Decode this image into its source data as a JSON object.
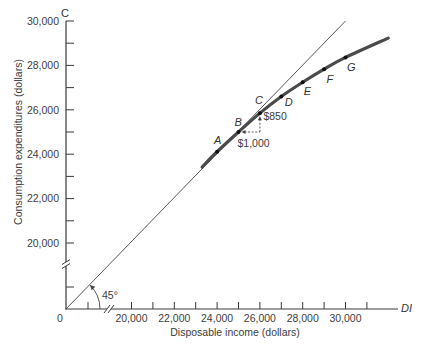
{
  "chart_data": {
    "type": "line",
    "title": "",
    "xlabel": "Disposable income (dollars)",
    "ylabel": "Consumption expenditures (dollars)",
    "x_axis_symbol": "DI",
    "y_axis_symbol": "C",
    "origin_label": "0",
    "xlim": [
      20000,
      31000
    ],
    "ylim": [
      20000,
      30000
    ],
    "axis_breaks": {
      "x": true,
      "y": true
    },
    "grid": false,
    "legend": null,
    "x_axis": {
      "ticks": [
        20000,
        21000,
        22000,
        23000,
        24000,
        25000,
        26000,
        27000,
        28000,
        29000,
        30000,
        31000
      ],
      "tick_labels": [
        {
          "value": 20000,
          "label": "20,000"
        },
        {
          "value": 22000,
          "label": "22,000"
        },
        {
          "value": 24000,
          "label": "24,000"
        },
        {
          "value": 26000,
          "label": "26,000"
        },
        {
          "value": 28000,
          "label": "28,000"
        },
        {
          "value": 30000,
          "label": "30,000"
        }
      ]
    },
    "y_axis": {
      "ticks": [
        20000,
        21000,
        22000,
        23000,
        24000,
        25000,
        26000,
        27000,
        28000,
        29000,
        30000
      ],
      "tick_labels": [
        {
          "value": 20000,
          "label": "20,000"
        },
        {
          "value": 22000,
          "label": "22,000"
        },
        {
          "value": 24000,
          "label": "24,000"
        },
        {
          "value": 26000,
          "label": "26,000"
        },
        {
          "value": 28000,
          "label": "28,000"
        },
        {
          "value": 30000,
          "label": "30,000"
        }
      ]
    },
    "series": [
      {
        "name": "Consumption function",
        "type": "curve",
        "color": "#4a4a4a",
        "points": [
          {
            "label": "A",
            "x": 24000,
            "y": 24110
          },
          {
            "label": "B",
            "x": 25000,
            "y": 25000
          },
          {
            "label": "C",
            "x": 26000,
            "y": 25850
          },
          {
            "label": "D",
            "x": 27000,
            "y": 26600
          },
          {
            "label": "E",
            "x": 28000,
            "y": 27240
          },
          {
            "label": "F",
            "x": 29000,
            "y": 27830
          },
          {
            "label": "G",
            "x": 30000,
            "y": 28360
          }
        ],
        "extent": {
          "start": [
            23300,
            23420
          ],
          "end": [
            32000,
            29230
          ]
        }
      },
      {
        "name": "45° line",
        "type": "line",
        "color": "#444444",
        "x": [
          0,
          30000
        ],
        "y": [
          0,
          30000
        ]
      }
    ],
    "annotations": {
      "mpc_run": {
        "text": "$1,000",
        "from": "B",
        "to": "C"
      },
      "mpc_rise": {
        "text": "$850",
        "from": "B",
        "to": "C"
      },
      "angle": {
        "text": "45°"
      }
    }
  }
}
